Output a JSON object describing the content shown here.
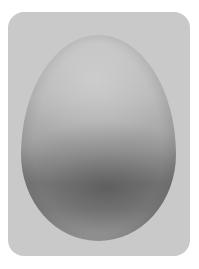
{
  "image": {
    "subject": "egg",
    "description": "Single egg photographed against a light gray rounded card background",
    "colors": {
      "page_background": "#ffffff",
      "card_background": "#c9c9c9",
      "egg_top": "#c2c2c2",
      "egg_shadow": "#7c7c7c"
    }
  }
}
